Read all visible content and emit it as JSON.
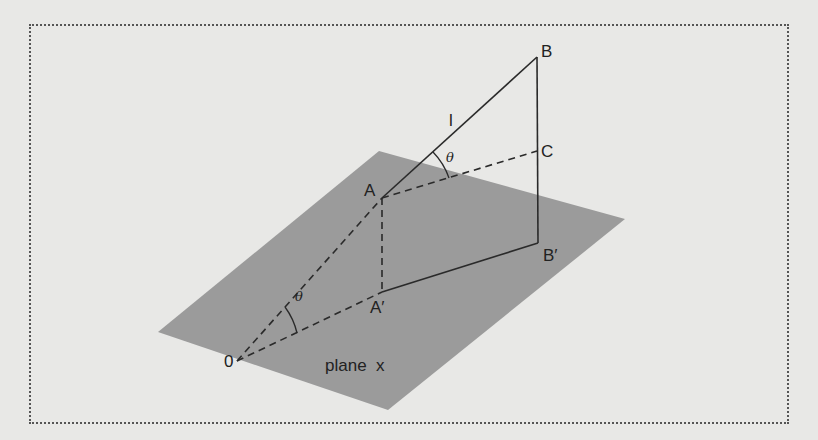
{
  "diagram": {
    "colors": {
      "background": "#e8e8e6",
      "plane": "#9b9b9b",
      "lines": "#2a2a2a",
      "border": "#555555"
    },
    "points": {
      "O": "0",
      "A": "A",
      "A_prime": "A′",
      "B": "B",
      "B_prime": "B′",
      "C": "C"
    },
    "line_label": "l",
    "angle_label_1": "θ",
    "angle_label_2": "θ",
    "plane_label": "plane  x"
  }
}
